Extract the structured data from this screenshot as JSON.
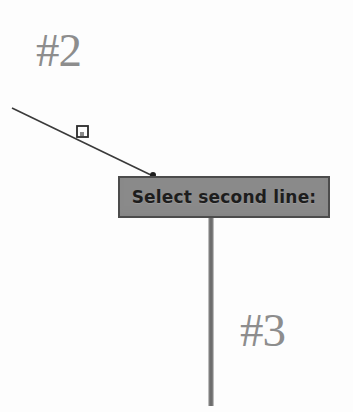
{
  "scene": {
    "background_color": "#fdfdfd",
    "width": 353,
    "height": 412
  },
  "labels": [
    {
      "name": "callout-2",
      "text": "#2",
      "color": "#8d8d8d",
      "x": 36,
      "y": 27
    },
    {
      "name": "callout-3",
      "text": "#3",
      "color": "#8d8d8d",
      "x": 240,
      "y": 307
    }
  ],
  "tooltip": {
    "text": "Select second line:",
    "fill_color": "#8a8a8a",
    "border_color": "#4c4c4c",
    "text_color": "#1d1d1d",
    "x": 118,
    "y": 176,
    "width": 212,
    "height": 42
  },
  "geometry": {
    "diagonal_line": {
      "name": "diagonal-line",
      "color": "#3a3a3a",
      "x1": 12,
      "y1": 108,
      "x2": 153,
      "y2": 176
    },
    "vertical_line": {
      "name": "vertical-line",
      "color": "#7d7d7d",
      "x1": 211,
      "y1": 218,
      "x2": 211,
      "y2": 406,
      "width": 5
    },
    "snap_marker": {
      "name": "midpoint-snap-marker",
      "shape": "square",
      "color": "#2b2b2b",
      "x": 82,
      "y": 131,
      "size": 11
    },
    "pick_point": {
      "name": "cursor-pick-point",
      "shape": "dot",
      "color": "#1e1e1e",
      "x": 153,
      "y": 175,
      "radius": 3
    }
  }
}
